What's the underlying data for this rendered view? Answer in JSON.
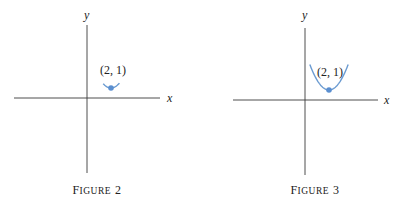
{
  "chart_data": [
    {
      "type": "line",
      "title": "",
      "caption": {
        "first": "F",
        "rest": "IGURE",
        "num": "2"
      },
      "xlabel": "x",
      "ylabel": "y",
      "xlim": [
        -3,
        3.1
      ],
      "ylim": [
        -3,
        2.7
      ],
      "series": [
        {
          "name": "parabola segment near vertex",
          "function": "(x-2)^2+1",
          "x_range": [
            1.35,
            2.7
          ]
        }
      ],
      "points": [
        {
          "x": 2,
          "y": 1,
          "label": "(2, 1)"
        }
      ],
      "grid": false
    },
    {
      "type": "line",
      "title": "",
      "caption": {
        "first": "F",
        "rest": "IGURE",
        "num": "3"
      },
      "xlabel": "x",
      "ylabel": "y",
      "xlim": [
        -3,
        3.1
      ],
      "ylim": [
        -3,
        2.7
      ],
      "series": [
        {
          "name": "parabola",
          "function": "(x-2)^2+1",
          "x_range": [
            0.4,
            3.6
          ]
        }
      ],
      "points": [
        {
          "x": 2,
          "y": 1,
          "label": "(2, 1)"
        }
      ],
      "grid": false
    }
  ],
  "colors": {
    "curve": "#6b9bd1",
    "point": "#5b8fd0",
    "axis": "#3a3a3a"
  }
}
